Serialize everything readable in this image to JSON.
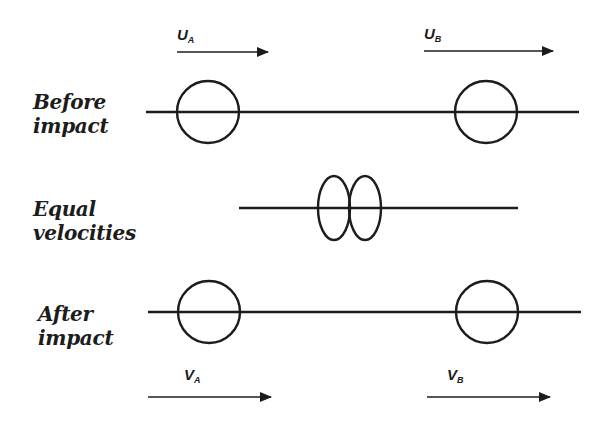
{
  "diagram": {
    "stroke_color": "#1c1c1c",
    "stages": [
      {
        "id": "before",
        "label_line1": "Before",
        "label_line2": "impact"
      },
      {
        "id": "equal",
        "label_line1": "Equal",
        "label_line2": "velocities"
      },
      {
        "id": "after",
        "label_line1": "After",
        "label_line2": "impact"
      }
    ],
    "velocities": {
      "before_a": {
        "symbol": "U",
        "subscript": "A"
      },
      "before_b": {
        "symbol": "U",
        "subscript": "B"
      },
      "after_a": {
        "symbol": "V",
        "subscript": "A"
      },
      "after_b": {
        "symbol": "V",
        "subscript": "B"
      }
    }
  }
}
